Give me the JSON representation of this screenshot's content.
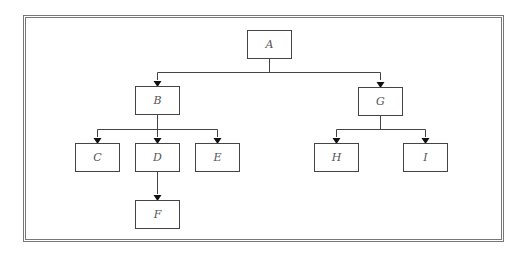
{
  "diagram": {
    "type": "tree",
    "nodes": [
      {
        "id": "A",
        "label": "A",
        "x": 247,
        "y": 30
      },
      {
        "id": "B",
        "label": "B",
        "x": 135,
        "y": 86
      },
      {
        "id": "G",
        "label": "G",
        "x": 358,
        "y": 87
      },
      {
        "id": "C",
        "label": "C",
        "x": 75,
        "y": 143
      },
      {
        "id": "D",
        "label": "D",
        "x": 135,
        "y": 143
      },
      {
        "id": "E",
        "label": "E",
        "x": 195,
        "y": 143
      },
      {
        "id": "F",
        "label": "F",
        "x": 135,
        "y": 200
      },
      {
        "id": "H",
        "label": "H",
        "x": 314,
        "y": 143
      },
      {
        "id": "I",
        "label": "I",
        "x": 403,
        "y": 143
      }
    ],
    "edges": [
      [
        "A",
        "B"
      ],
      [
        "A",
        "G"
      ],
      [
        "B",
        "C"
      ],
      [
        "B",
        "D"
      ],
      [
        "B",
        "E"
      ],
      [
        "D",
        "F"
      ],
      [
        "G",
        "H"
      ],
      [
        "G",
        "I"
      ]
    ]
  }
}
